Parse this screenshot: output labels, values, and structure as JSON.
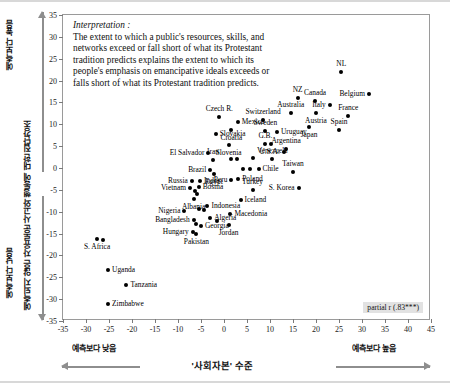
{
  "axes": {
    "y_title": "예측되지 않은 자유로운 사고와 행동에 대한 집단강조",
    "y_high_label": "예측보다 높음",
    "y_low_label": "예측보다 낮음",
    "x_title": "'사회자본' 수준",
    "x_low_label": "예측보다 낮음",
    "x_high_label": "예측보다 높음"
  },
  "interpretation": {
    "heading": "Interpretation :",
    "body": "The extent to which a public's resources, skills, and networks exceed or fall short of what its Protestant tradition predicts explains the extent to which its people's emphasis on emancipative ideals exceeds or falls short of what its Protestant tradition predicts."
  },
  "annotation": {
    "partial_r": "partial r (.83***)"
  },
  "chart_data": {
    "type": "scatter",
    "title": "",
    "xlabel": "'사회자본' 수준",
    "ylabel": "예측되지 않은 자유로운 사고와 행동에 대한 집단강조",
    "xlim": [
      -35,
      45
    ],
    "ylim": [
      -35,
      35
    ],
    "xticks": [
      -35,
      -30,
      -25,
      -20,
      -15,
      -10,
      -5,
      0,
      5,
      10,
      15,
      20,
      25,
      30,
      35,
      40,
      45
    ],
    "yticks": [
      35,
      30,
      25,
      20,
      15,
      10,
      5,
      0,
      -5,
      -10,
      -15,
      -20,
      -25,
      -30,
      -35
    ],
    "grid": false,
    "legend": false,
    "marker": "filled-circle",
    "points": [
      {
        "label": "NL",
        "x": 25.5,
        "y": 22.0,
        "lp": "c"
      },
      {
        "label": "Belgium",
        "x": 31.5,
        "y": 17.0,
        "lp": "r"
      },
      {
        "label": "NZ",
        "x": 16.0,
        "y": 16.0,
        "lp": "c"
      },
      {
        "label": "Canada",
        "x": 19.8,
        "y": 15.4,
        "lp": "c"
      },
      {
        "label": "Italy",
        "x": 23.0,
        "y": 14.3,
        "lp": "r"
      },
      {
        "label": "Australia",
        "x": 14.5,
        "y": 12.5,
        "lp": "c"
      },
      {
        "label": "Austria",
        "x": 20.0,
        "y": 12.6,
        "lp": "cb"
      },
      {
        "label": "France",
        "x": 27.0,
        "y": 12.0,
        "lp": "c"
      },
      {
        "label": "Switzerland",
        "x": 8.5,
        "y": 11.0,
        "lp": "c"
      },
      {
        "label": "Sweden",
        "x": 9.0,
        "y": 8.5,
        "lp": "c"
      },
      {
        "label": "Spain",
        "x": 25.0,
        "y": 8.6,
        "lp": "c"
      },
      {
        "label": "Uruguay",
        "x": 11.5,
        "y": 8.2,
        "lp": "l"
      },
      {
        "label": "Japan",
        "x": 18.5,
        "y": 9.3,
        "lp": "cb"
      },
      {
        "label": "Czech R.",
        "x": -1.0,
        "y": 11.6,
        "lp": "c"
      },
      {
        "label": "Mexico",
        "x": 3.0,
        "y": 10.6,
        "lp": "l"
      },
      {
        "label": "Croatia",
        "x": 1.6,
        "y": 8.8,
        "lp": "cb"
      },
      {
        "label": "Slovakia",
        "x": -1.8,
        "y": 7.8,
        "lp": "l"
      },
      {
        "label": "G.B.",
        "x": 9.0,
        "y": 5.4,
        "lp": "c"
      },
      {
        "label": "",
        "x": 10.2,
        "y": 5.4,
        "lp": "none"
      },
      {
        "label": "Argentina",
        "x": 13.5,
        "y": 4.3,
        "lp": "c"
      },
      {
        "label": "Slovenia",
        "x": 1.0,
        "y": 5.2,
        "lp": "cb"
      },
      {
        "label": "U.S.A.",
        "x": 13.0,
        "y": 3.6,
        "lp": "r"
      },
      {
        "label": "Venezuela",
        "x": 10.5,
        "y": 2.0,
        "lp": "c"
      },
      {
        "label": "El Salvador",
        "x": -3.4,
        "y": 3.4,
        "lp": "r"
      },
      {
        "label": "Iran",
        "x": -2.4,
        "y": 1.9,
        "lp": "c"
      },
      {
        "label": "",
        "x": 1.5,
        "y": 2.1,
        "lp": "none"
      },
      {
        "label": "",
        "x": 2.8,
        "y": 2.1,
        "lp": "none"
      },
      {
        "label": "",
        "x": 6.2,
        "y": 2.4,
        "lp": "none"
      },
      {
        "label": "Taiwan",
        "x": 15.0,
        "y": -1.0,
        "lp": "c"
      },
      {
        "label": "Chile",
        "x": 7.5,
        "y": -0.3,
        "lp": "l"
      },
      {
        "label": "",
        "x": 4.2,
        "y": -0.2,
        "lp": "none"
      },
      {
        "label": "",
        "x": 5.6,
        "y": -0.3,
        "lp": "none"
      },
      {
        "label": "Brazil",
        "x": -3.0,
        "y": -0.4,
        "lp": "r"
      },
      {
        "label": "Egypt",
        "x": -2.2,
        "y": -1.4,
        "lp": "cb"
      },
      {
        "label": "Poland",
        "x": 3.1,
        "y": -2.6,
        "lp": "l"
      },
      {
        "label": "Peru",
        "x": 1.6,
        "y": -2.8,
        "lp": "r"
      },
      {
        "label": "India",
        "x": -5.2,
        "y": -2.9,
        "lp": "l"
      },
      {
        "label": "Russia",
        "x": -7.0,
        "y": -3.0,
        "lp": "r"
      },
      {
        "label": "S. Korea",
        "x": 16.2,
        "y": -4.6,
        "lp": "r"
      },
      {
        "label": "Turkey",
        "x": 6.2,
        "y": -5.0,
        "lp": "c"
      },
      {
        "label": "Bosnia",
        "x": -5.5,
        "y": -4.4,
        "lp": "l"
      },
      {
        "label": "Vietnam",
        "x": -7.4,
        "y": -4.6,
        "lp": "r"
      },
      {
        "label": "",
        "x": -6.2,
        "y": -5.2,
        "lp": "none"
      },
      {
        "label": "",
        "x": -5.8,
        "y": -6.0,
        "lp": "none"
      },
      {
        "label": "Albania",
        "x": -6.6,
        "y": -7.2,
        "lp": "cb"
      },
      {
        "label": "Iceland",
        "x": 3.6,
        "y": -7.4,
        "lp": "l"
      },
      {
        "label": "Indonesia",
        "x": -3.6,
        "y": -8.6,
        "lp": "l"
      },
      {
        "label": "Nigeria",
        "x": -8.6,
        "y": -9.9,
        "lp": "r"
      },
      {
        "label": "",
        "x": -5.5,
        "y": -9.4,
        "lp": "none"
      },
      {
        "label": "",
        "x": -4.4,
        "y": -9.5,
        "lp": "none"
      },
      {
        "label": "Macedonia",
        "x": 1.4,
        "y": -10.6,
        "lp": "l"
      },
      {
        "label": "Algeria",
        "x": -3.0,
        "y": -11.5,
        "lp": "l"
      },
      {
        "label": "",
        "x": -1.6,
        "y": -12.2,
        "lp": "none"
      },
      {
        "label": "Bangladesh",
        "x": -6.6,
        "y": -12.0,
        "lp": "r"
      },
      {
        "label": "",
        "x": -6.1,
        "y": -12.8,
        "lp": "none"
      },
      {
        "label": "Georgia",
        "x": -5.0,
        "y": -13.2,
        "lp": "l"
      },
      {
        "label": "Jordan",
        "x": 1.0,
        "y": -13.0,
        "lp": "cb"
      },
      {
        "label": "Hungary",
        "x": -6.8,
        "y": -14.6,
        "lp": "r"
      },
      {
        "label": "Pakistan",
        "x": -6.0,
        "y": -15.0,
        "lp": "cb"
      },
      {
        "label": "S. Africa",
        "x": -27.6,
        "y": -16.2,
        "lp": "cb"
      },
      {
        "label": "",
        "x": -26.4,
        "y": -16.4,
        "lp": "none"
      },
      {
        "label": "Uganda",
        "x": -25.2,
        "y": -23.4,
        "lp": "l"
      },
      {
        "label": "Tanzania",
        "x": -21.2,
        "y": -26.8,
        "lp": "l"
      },
      {
        "label": "Zimbabwe",
        "x": -25.2,
        "y": -31.2,
        "lp": "l"
      }
    ]
  }
}
